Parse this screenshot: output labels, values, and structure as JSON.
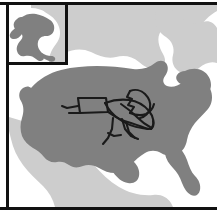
{
  "figure": {
    "kind": "distribution-map",
    "region_label": "United States",
    "width_px": 217,
    "height_px": 215
  },
  "colors": {
    "ocean": "#ffffff",
    "neighbor_land": "#cdcdcd",
    "range_fill": "#808080",
    "frame": "#111111",
    "insect_line": "#1a1a1a",
    "inset_border": "#111111"
  },
  "frame": {
    "top_rule": "top-frame-rule",
    "bottom_rule": "bottom-frame-rule",
    "left_rule": "left-frame-rule"
  },
  "inset": {
    "name": "alaska-inset",
    "label": "Alaska",
    "border_color": "#111111",
    "land_fill": "#808080",
    "surround_fill": "#cdcdcd"
  },
  "main_map": {
    "name": "contiguous-us-map",
    "range_label": "Distribution range (shaded)",
    "neighbor_label": "Adjacent landmass",
    "ocean_label": "Ocean"
  },
  "overlay": {
    "name": "insect-illustration",
    "label": "Insect line drawing",
    "stroke_color": "#1a1a1a",
    "stroke_width": 2.1
  },
  "chart_data": {
    "type": "map",
    "title": "",
    "subtitle": "",
    "legend": [
      {
        "label": "Distribution range",
        "color": "#808080"
      },
      {
        "label": "Adjacent land",
        "color": "#cdcdcd"
      },
      {
        "label": "Water",
        "color": "#ffffff"
      }
    ],
    "regions": [
      {
        "name": "Contiguous United States",
        "fill": "#808080",
        "shaded": true
      },
      {
        "name": "Alaska",
        "fill": "#808080",
        "shaded": true,
        "inset": true
      },
      {
        "name": "Canada",
        "fill": "#cdcdcd",
        "shaded": false
      },
      {
        "name": "Mexico",
        "fill": "#cdcdcd",
        "shaded": false
      }
    ],
    "annotations": [
      {
        "name": "insect-illustration",
        "type": "line-drawing",
        "placement": "central-eastern-us"
      }
    ],
    "grid": false,
    "legend_position": "none"
  }
}
